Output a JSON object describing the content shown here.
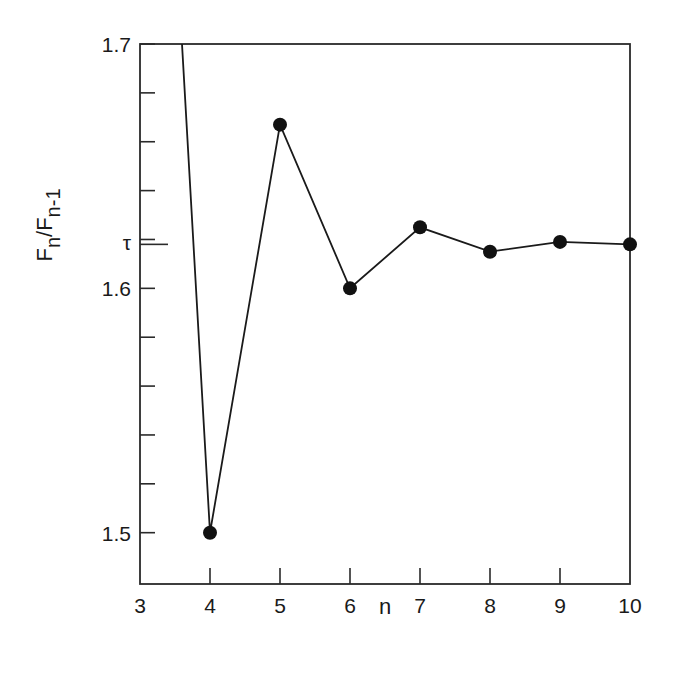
{
  "chart_data": {
    "type": "line",
    "title": "",
    "xlabel": "n",
    "ylabel": "F_n/F_n-1",
    "ylabel_parts": {
      "main": "F",
      "sub1": "n",
      "sep": "/F",
      "sub2": "n-1"
    },
    "x": [
      3,
      4,
      5,
      6,
      7,
      8,
      9,
      10
    ],
    "series": [
      {
        "name": "F_n/F_n-1",
        "x": [
          3,
          4,
          5,
          6,
          7,
          8,
          9,
          10
        ],
        "values": [
          2.0,
          1.5,
          1.667,
          1.6,
          1.625,
          1.615,
          1.619,
          1.618
        ],
        "markers": [
          false,
          true,
          true,
          true,
          true,
          true,
          true,
          true
        ]
      }
    ],
    "xlim": [
      3,
      10
    ],
    "ylim": [
      1.479,
      1.7
    ],
    "xticks": [
      "3",
      "4",
      "5",
      "6",
      "7",
      "8",
      "9",
      "10"
    ],
    "yticks": [
      {
        "value": 1.5,
        "label": "1.5"
      },
      {
        "value": 1.6,
        "label": "1.6"
      },
      {
        "value": 1.7,
        "label": "1.7"
      }
    ],
    "yminor_ticks": [
      1.52,
      1.54,
      1.56,
      1.58,
      1.62,
      1.64,
      1.66,
      1.68
    ],
    "annotations": [
      {
        "value": 1.618,
        "label": "τ",
        "axis": "y"
      }
    ],
    "grid": false,
    "legend": null,
    "colors": {
      "line": "#1a1a1a",
      "marker": "#111111",
      "axis": "#2a2a2a"
    }
  }
}
